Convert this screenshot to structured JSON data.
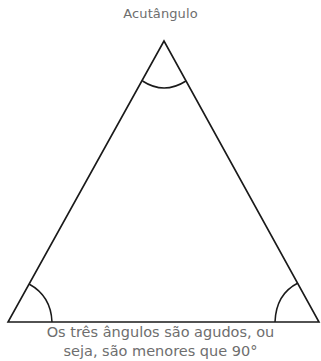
{
  "title": "Acutângulo",
  "caption": {
    "line1": "Os três ângulos são agudos, ou",
    "line2": "seja, são menores que 90°"
  },
  "diagram": {
    "shape": "acute triangle",
    "vertices": {
      "apex": [
        164,
        41
      ],
      "base_left": [
        8,
        322
      ],
      "base_right": [
        319,
        322
      ]
    },
    "angle_marks": [
      "apex-arc",
      "left-base-arc",
      "right-base-arc"
    ],
    "stroke_color": "#1a1a1a"
  }
}
